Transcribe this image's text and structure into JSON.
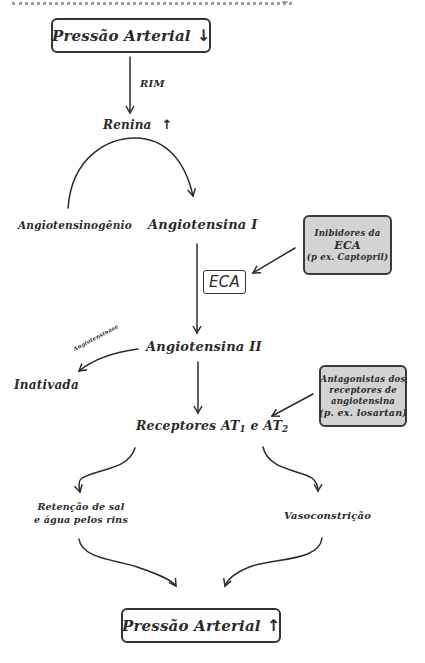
{
  "diagram": {
    "type": "flowchart",
    "topic": "Sistema renina-angiotensina",
    "nodes": {
      "pressao_baixa": {
        "label": "Pressão Arterial",
        "arrow": "↓"
      },
      "rim_label": "RIM",
      "renina": {
        "label": "Renina",
        "arrow": "↑"
      },
      "angiotensinogenio": "Angiotensinogênio",
      "angiotensina_1": "Angiotensina I",
      "eca": "ECA",
      "inibidores_eca": {
        "line1": "Inibidores da",
        "line2": "ECA",
        "line3": "(p ex. Captopril)"
      },
      "angiotensina_2": "Angiotensina II",
      "angiotensinase_label": "Angiotensinase",
      "inativada": "Inativada",
      "antagonistas": {
        "line1": "Antagonistas dos",
        "line2": "receptores de",
        "line3": "angiotensina",
        "line4": "(p. ex. losartan)"
      },
      "receptores": {
        "prefix": "Receptores AT",
        "sub1": "1",
        "mid": " e AT",
        "sub2": "2"
      },
      "retencao": {
        "line1": "Retenção de sal",
        "line2": "e água pelos rins"
      },
      "vasoconstricao": "Vasoconstrição",
      "pressao_alta": {
        "label": "Pressão Arterial",
        "arrow": "↑"
      }
    },
    "edges": [
      {
        "from": "Pressão Arterial ↓",
        "to": "Renina ↑",
        "label": "RIM"
      },
      {
        "from": "Angiotensinogênio",
        "to": "Angiotensina I",
        "via": "Renina"
      },
      {
        "from": "Angiotensina I",
        "to": "Angiotensina II",
        "via": "ECA"
      },
      {
        "from": "Inibidores da ECA",
        "to": "ECA",
        "kind": "inhibits"
      },
      {
        "from": "Angiotensina II",
        "to": "Inativada",
        "label": "Angiotensinase"
      },
      {
        "from": "Angiotensina II",
        "to": "Receptores AT1 e AT2"
      },
      {
        "from": "Antagonistas dos receptores de angiotensina",
        "to": "Receptores AT1 e AT2",
        "kind": "inhibits"
      },
      {
        "from": "Receptores AT1 e AT2",
        "to": "Retenção de sal e água pelos rins"
      },
      {
        "from": "Receptores AT1 e AT2",
        "to": "Vasoconstrição"
      },
      {
        "from": "Retenção de sal e água pelos rins",
        "to": "Pressão Arterial ↑"
      },
      {
        "from": "Vasoconstrição",
        "to": "Pressão Arterial ↑"
      }
    ],
    "colors": {
      "ink": "#2b2b2b",
      "drug_box_fill": "#d3d3d3",
      "background": "#ffffff"
    }
  }
}
